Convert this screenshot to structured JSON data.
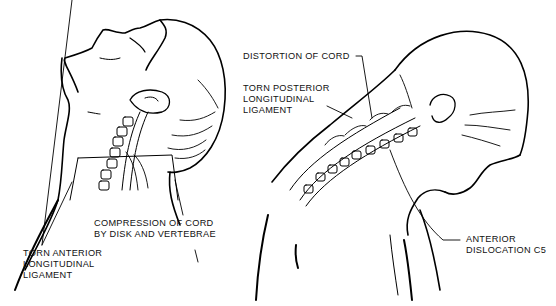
{
  "diagram": {
    "panels": [
      {
        "id": "left",
        "description": "Head tilted back (hyperextension) with cervical vertebrae shown",
        "labels": [
          {
            "id": "compression",
            "lines": [
              "COMPRESSION OF CORD",
              "BY DISK AND VERTEBRAE"
            ]
          },
          {
            "id": "torn-anterior",
            "lines": [
              "TORN ANTERIOR",
              "LONGITUDINAL",
              "LIGAMENT"
            ]
          }
        ]
      },
      {
        "id": "right",
        "description": "Head bent forward (hyperflexion) with cervical vertebrae shown",
        "labels": [
          {
            "id": "distortion",
            "lines": [
              "DISTORTION OF CORD"
            ]
          },
          {
            "id": "torn-posterior",
            "lines": [
              "TORN POSTERIOR",
              "LONGITUDINAL",
              "LIGAMENT"
            ]
          },
          {
            "id": "anterior-dislocation",
            "lines": [
              "ANTERIOR",
              "DISLOCATION C5"
            ]
          }
        ]
      }
    ],
    "colors": {
      "line": "#000000",
      "background": "#ffffff"
    }
  }
}
